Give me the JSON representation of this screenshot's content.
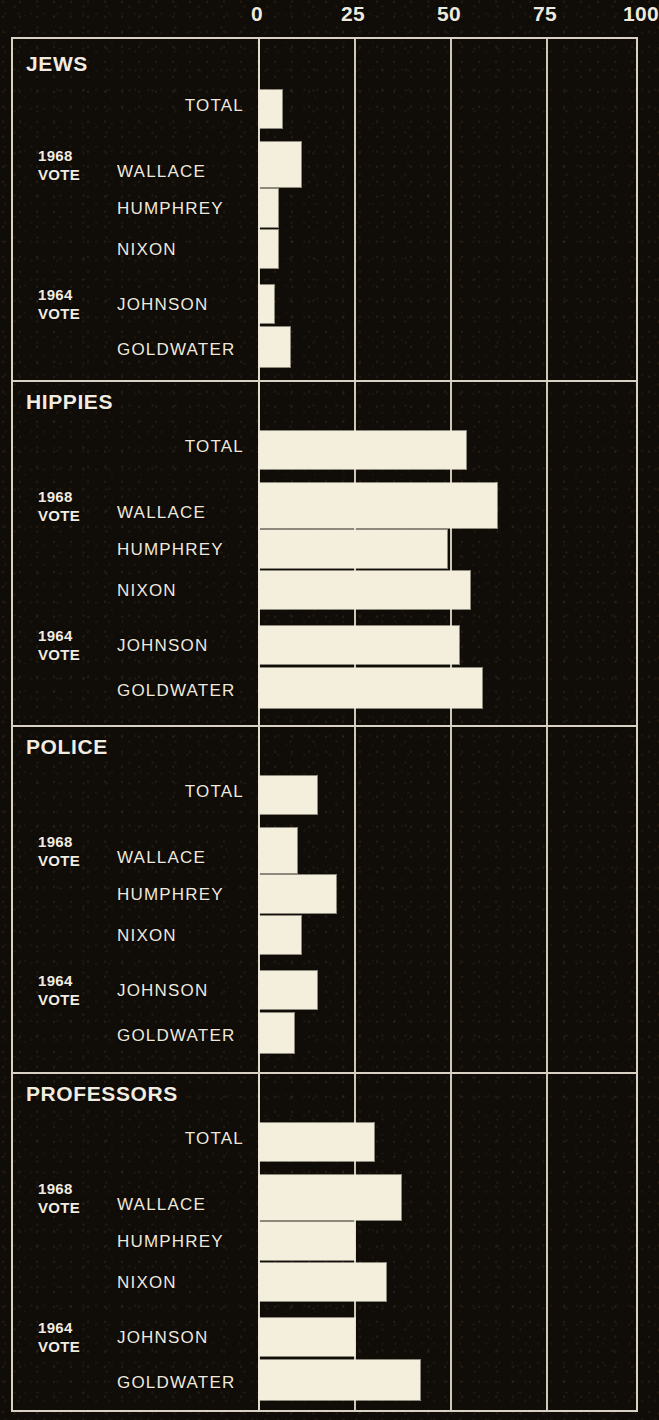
{
  "chart_data": {
    "type": "bar",
    "orientation": "horizontal",
    "title": "",
    "xlabel": "",
    "ylabel": "",
    "xlim": [
      0,
      100
    ],
    "xticks": [
      0,
      25,
      50,
      75,
      100
    ],
    "xtick_labels": [
      "0",
      "25",
      "50",
      "75",
      "100"
    ],
    "grid": true,
    "legend": null,
    "bar_color": "#f4eedd",
    "background_color": "#100c08",
    "frame_color": "#d9d2c4",
    "row_categories": [
      "TOTAL",
      "WALLACE",
      "HUMPHREY",
      "NIXON",
      "JOHNSON",
      "GOLDWATER"
    ],
    "group_captions": [
      {
        "line1": "1968",
        "line2": "VOTE",
        "rows": [
          "WALLACE",
          "HUMPHREY",
          "NIXON"
        ]
      },
      {
        "line1": "1964",
        "line2": "VOTE",
        "rows": [
          "JOHNSON",
          "GOLDWATER"
        ]
      }
    ],
    "panels": [
      {
        "title": "JEWS",
        "rows": [
          {
            "label": "TOTAL",
            "value": 6
          },
          {
            "label": "WALLACE",
            "value": 11
          },
          {
            "label": "HUMPHREY",
            "value": 5
          },
          {
            "label": "NIXON",
            "value": 5
          },
          {
            "label": "JOHNSON",
            "value": 4
          },
          {
            "label": "GOLDWATER",
            "value": 8
          }
        ]
      },
      {
        "title": "HIPPIES",
        "rows": [
          {
            "label": "TOTAL",
            "value": 54
          },
          {
            "label": "WALLACE",
            "value": 62
          },
          {
            "label": "HUMPHREY",
            "value": 49
          },
          {
            "label": "NIXON",
            "value": 55
          },
          {
            "label": "JOHNSON",
            "value": 52
          },
          {
            "label": "GOLDWATER",
            "value": 58
          }
        ]
      },
      {
        "title": "POLICE",
        "rows": [
          {
            "label": "TOTAL",
            "value": 15
          },
          {
            "label": "WALLACE",
            "value": 10
          },
          {
            "label": "HUMPHREY",
            "value": 20
          },
          {
            "label": "NIXON",
            "value": 11
          },
          {
            "label": "JOHNSON",
            "value": 15
          },
          {
            "label": "GOLDWATER",
            "value": 9
          }
        ]
      },
      {
        "title": "PROFESSORS",
        "rows": [
          {
            "label": "TOTAL",
            "value": 30
          },
          {
            "label": "WALLACE",
            "value": 37
          },
          {
            "label": "HUMPHREY",
            "value": 25
          },
          {
            "label": "NIXON",
            "value": 33
          },
          {
            "label": "JOHNSON",
            "value": 25
          },
          {
            "label": "GOLDWATER",
            "value": 42
          }
        ]
      }
    ]
  }
}
